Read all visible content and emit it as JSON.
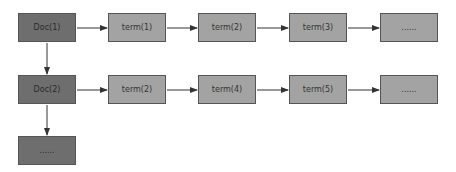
{
  "diagram": {
    "rows": [
      {
        "doc": "Doc(1)",
        "terms": [
          "term(1)",
          "term(2)",
          "term(3)",
          "......"
        ]
      },
      {
        "doc": "Doc(2)",
        "terms": [
          "term(2)",
          "term(4)",
          "term(5)",
          "......"
        ]
      }
    ],
    "more_docs": "......",
    "colors": {
      "doc": "#6e6e6e",
      "term": "#a3a3a3",
      "border": "#555555",
      "arrow": "#333333"
    }
  }
}
